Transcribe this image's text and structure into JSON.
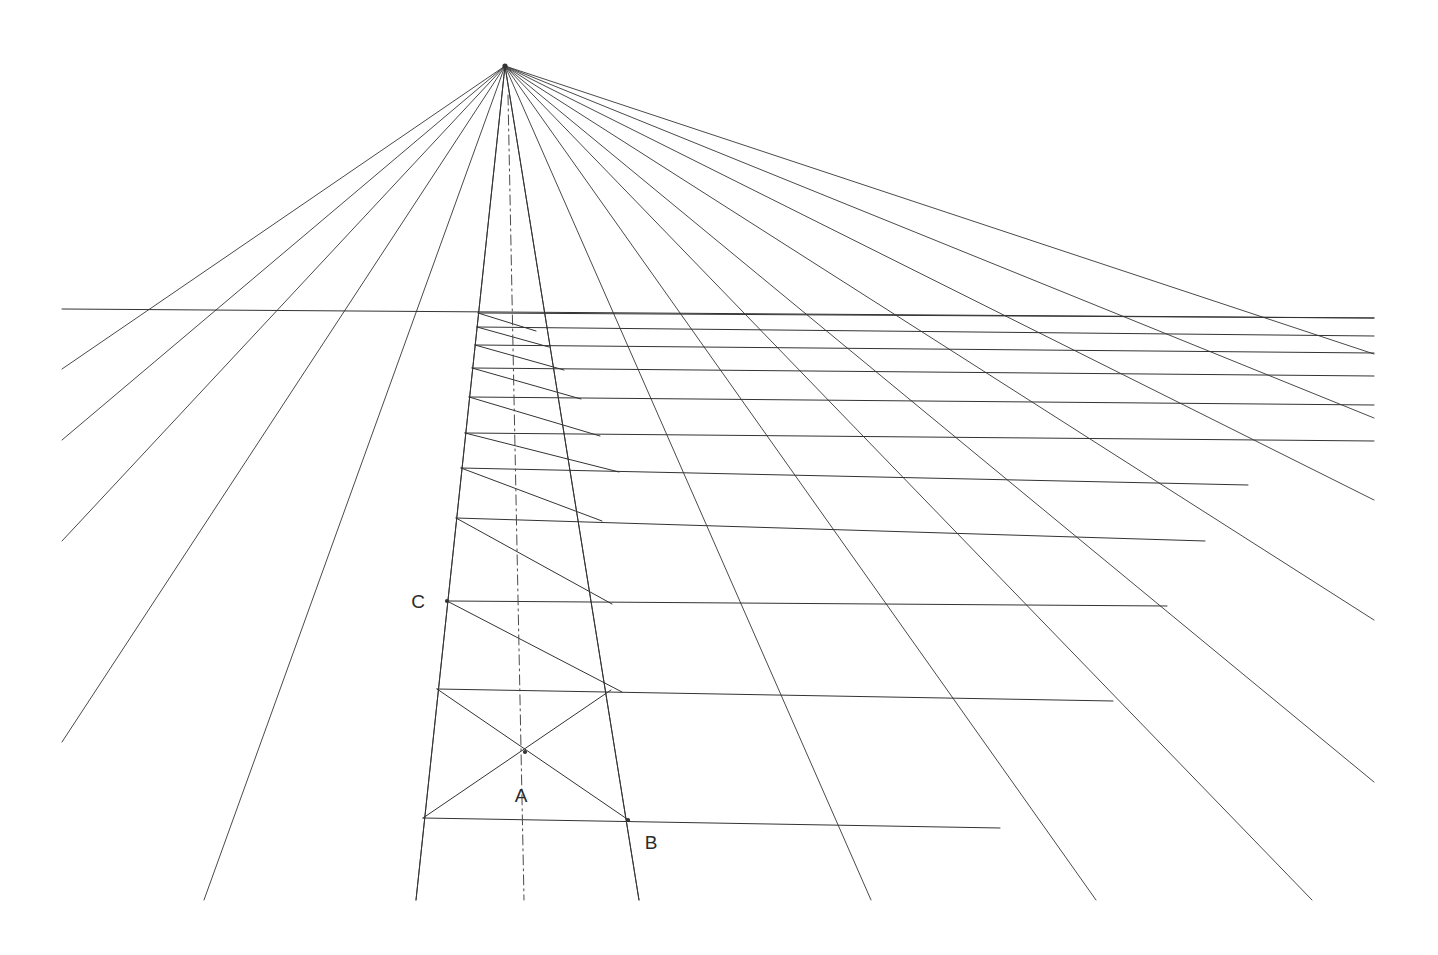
{
  "canvas": {
    "width": 1438,
    "height": 955,
    "background": "#ffffff",
    "title": "One-point perspective grid construction"
  },
  "style": {
    "line_color": "#4a4a4a",
    "line_color_strong": "#333333",
    "line_width": 1.0,
    "label_color": "#2b2b2b",
    "label_font_size": 19
  },
  "labels": [
    {
      "id": "label-a",
      "text": "A",
      "x": 521,
      "y": 802
    },
    {
      "id": "label-b",
      "text": "B",
      "x": 651,
      "y": 849
    },
    {
      "id": "label-c",
      "text": "C",
      "x": 418,
      "y": 608
    }
  ],
  "points": [
    {
      "id": "vanishing-point",
      "name": "VP",
      "x": 505,
      "y": 66
    },
    {
      "id": "point-a",
      "name": "A",
      "x": 525,
      "y": 752
    },
    {
      "id": "point-b",
      "name": "B",
      "x": 628,
      "y": 820
    },
    {
      "id": "point-c",
      "name": "C",
      "x": 447,
      "y": 601
    }
  ],
  "horizon": {
    "id": "horizon-line",
    "x1": 62,
    "y1": 309,
    "x2": 1374,
    "y2": 318
  },
  "vp_rays": [
    {
      "id": "ray-1",
      "x2": 62,
      "y2": 369
    },
    {
      "id": "ray-2",
      "x2": 62,
      "y2": 440
    },
    {
      "id": "ray-3",
      "x2": 62,
      "y2": 541
    },
    {
      "id": "ray-4",
      "x2": 62,
      "y2": 742
    },
    {
      "id": "ray-5",
      "x2": 204,
      "y2": 900
    },
    {
      "id": "ray-6",
      "x2": 416,
      "y2": 900
    },
    {
      "id": "ray-7",
      "x2": 639,
      "y2": 900
    },
    {
      "id": "ray-8",
      "x2": 871,
      "y2": 900
    },
    {
      "id": "ray-9",
      "x2": 1096,
      "y2": 900
    },
    {
      "id": "ray-10",
      "x2": 1312,
      "y2": 900
    },
    {
      "id": "ray-11",
      "x2": 1374,
      "y2": 782
    },
    {
      "id": "ray-12",
      "x2": 1374,
      "y2": 620
    },
    {
      "id": "ray-13",
      "x2": 1374,
      "y2": 500
    },
    {
      "id": "ray-14",
      "x2": 1374,
      "y2": 418
    },
    {
      "id": "ray-15",
      "x2": 1374,
      "y2": 354
    }
  ],
  "center_axis": {
    "id": "center-dash-dot-axis",
    "x1": 508,
    "y1": 95,
    "x2": 524,
    "y2": 900,
    "dash": "10 4 2 4"
  },
  "transversals": [
    {
      "id": "t-00",
      "x1": 478,
      "y1": 313,
      "x2": 1374,
      "y2": 318
    },
    {
      "id": "t-01",
      "x1": 477,
      "y1": 327,
      "x2": 1374,
      "y2": 336
    },
    {
      "id": "t-02",
      "x1": 475,
      "y1": 345,
      "x2": 1374,
      "y2": 353
    },
    {
      "id": "t-03",
      "x1": 472,
      "y1": 368,
      "x2": 1374,
      "y2": 376
    },
    {
      "id": "t-04",
      "x1": 469,
      "y1": 397,
      "x2": 1374,
      "y2": 405
    },
    {
      "id": "t-05",
      "x1": 465,
      "y1": 433,
      "x2": 1374,
      "y2": 441
    },
    {
      "id": "t-06",
      "x1": 461,
      "y1": 468,
      "x2": 1248,
      "y2": 485
    },
    {
      "id": "t-07",
      "x1": 456,
      "y1": 518,
      "x2": 1205,
      "y2": 541
    },
    {
      "id": "t-08",
      "x1": 447,
      "y1": 601,
      "x2": 1167,
      "y2": 606
    },
    {
      "id": "t-09",
      "x1": 437,
      "y1": 689,
      "x2": 1113,
      "y2": 701
    },
    {
      "id": "t-10",
      "x1": 423,
      "y1": 818,
      "x2": 1000,
      "y2": 828
    }
  ],
  "diagonals": [
    {
      "id": "d-01",
      "x1": 478,
      "y1": 313,
      "x2": 536,
      "y2": 331
    },
    {
      "id": "d-02",
      "x1": 477,
      "y1": 327,
      "x2": 549,
      "y2": 347
    },
    {
      "id": "d-03",
      "x1": 475,
      "y1": 345,
      "x2": 564,
      "y2": 370
    },
    {
      "id": "d-04",
      "x1": 472,
      "y1": 368,
      "x2": 581,
      "y2": 399
    },
    {
      "id": "d-05",
      "x1": 469,
      "y1": 397,
      "x2": 600,
      "y2": 436
    },
    {
      "id": "d-06",
      "x1": 465,
      "y1": 433,
      "x2": 619,
      "y2": 472
    },
    {
      "id": "d-07",
      "x1": 461,
      "y1": 468,
      "x2": 602,
      "y2": 521
    },
    {
      "id": "d-08",
      "x1": 456,
      "y1": 518,
      "x2": 612,
      "y2": 604
    },
    {
      "id": "d-09",
      "x1": 447,
      "y1": 601,
      "x2": 622,
      "y2": 692
    },
    {
      "id": "d-10",
      "x1": 437,
      "y1": 689,
      "x2": 630,
      "y2": 821
    },
    {
      "id": "d-11",
      "x1": 423,
      "y1": 818,
      "x2": 611,
      "y2": 690
    }
  ],
  "edge_rays": [
    {
      "id": "edge-left-vertical",
      "x1": 505,
      "y1": 66,
      "x2": 416,
      "y2": 900
    },
    {
      "id": "edge-right-vertical",
      "x1": 505,
      "y1": 66,
      "x2": 639,
      "y2": 900
    }
  ],
  "legend": {
    "description": "Converging orthogonals from a single vanishing point with a horizon line, stacked transversals and construction diagonals forming a receding floor grid.",
    "marked_points": [
      "A",
      "B",
      "C"
    ],
    "vanishing_point_label": "VP"
  }
}
